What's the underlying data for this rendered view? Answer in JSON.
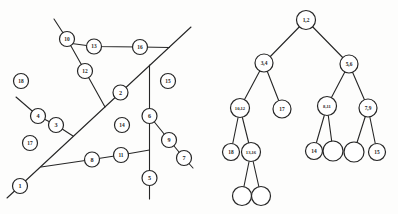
{
  "figure": {
    "colors": {
      "ink": "#262626",
      "paper": "#fdfdfc"
    },
    "graph": {
      "node_radius": 7.5,
      "nodes": [
        {
          "id": "1",
          "x": 20,
          "y": 186
        },
        {
          "id": "2",
          "x": 120.5,
          "y": 92.5
        },
        {
          "id": "3",
          "x": 56,
          "y": 125
        },
        {
          "id": "4",
          "x": 38,
          "y": 116
        },
        {
          "id": "5",
          "x": 149.5,
          "y": 178
        },
        {
          "id": "6",
          "x": 149.5,
          "y": 116
        },
        {
          "id": "7",
          "x": 184,
          "y": 158
        },
        {
          "id": "8",
          "x": 92,
          "y": 159.5
        },
        {
          "id": "9",
          "x": 169,
          "y": 140
        },
        {
          "id": "10",
          "x": 67,
          "y": 39
        },
        {
          "id": "11",
          "x": 121,
          "y": 155
        },
        {
          "id": "12",
          "x": 85,
          "y": 71
        },
        {
          "id": "13",
          "x": 94,
          "y": 46.5
        },
        {
          "id": "14",
          "x": 122,
          "y": 125
        },
        {
          "id": "15",
          "x": 168,
          "y": 81
        },
        {
          "id": "16",
          "x": 140,
          "y": 47
        },
        {
          "id": "17",
          "x": 30,
          "y": 143
        },
        {
          "id": "18",
          "x": 21,
          "y": 81
        }
      ],
      "segments": [
        {
          "name": "cut-line-1-2",
          "points": [
            [
              7,
              198
            ],
            [
              191,
              27
            ]
          ]
        },
        {
          "name": "cut-line-10-12",
          "points": [
            [
              54,
              19
            ],
            [
              67,
              39
            ],
            [
              85,
              71
            ],
            [
              105,
              107
            ]
          ]
        },
        {
          "name": "cut-line-13-16",
          "points": [
            [
              68,
              43
            ],
            [
              94,
              46.5
            ],
            [
              140,
              47
            ],
            [
              169.5,
              47.5
            ]
          ]
        },
        {
          "name": "cut-line-5-6",
          "points": [
            [
              149.5,
              65
            ],
            [
              149.5,
              199
            ]
          ]
        },
        {
          "name": "cut-line-7-9",
          "points": [
            [
              149.5,
              116
            ],
            [
              169,
              140
            ],
            [
              184,
              158
            ],
            [
              193,
              168
            ]
          ]
        },
        {
          "name": "cut-line-8-11",
          "points": [
            [
              41,
              167
            ],
            [
              92,
              159.5
            ],
            [
              121,
              155
            ],
            [
              149.5,
              150
            ]
          ]
        },
        {
          "name": "cut-line-3-4",
          "points": [
            [
              16,
              97
            ],
            [
              38,
              116
            ],
            [
              56,
              125
            ],
            [
              73,
              136
            ]
          ]
        }
      ]
    },
    "tree": {
      "nodes": [
        {
          "id": "t1",
          "label": "1,2",
          "x": 306,
          "y": 20,
          "r": 9.5
        },
        {
          "id": "t2",
          "label": "3,4",
          "x": 264,
          "y": 63,
          "r": 9
        },
        {
          "id": "t3",
          "label": "5,6",
          "x": 349,
          "y": 64,
          "r": 9
        },
        {
          "id": "t4",
          "label": "10,12",
          "x": 240,
          "y": 108,
          "r": 9.5
        },
        {
          "id": "t5",
          "label": "17",
          "x": 282,
          "y": 109,
          "r": 9
        },
        {
          "id": "t6",
          "label": "8,11",
          "x": 327,
          "y": 106,
          "r": 9.5
        },
        {
          "id": "t7",
          "label": "7,9",
          "x": 368,
          "y": 108,
          "r": 9
        },
        {
          "id": "t8",
          "label": "18",
          "x": 231,
          "y": 152,
          "r": 8.5
        },
        {
          "id": "t9",
          "label": "13,16",
          "x": 251,
          "y": 152,
          "r": 9.5
        },
        {
          "id": "t10",
          "label": "14",
          "x": 314,
          "y": 151,
          "r": 8.5
        },
        {
          "id": "t11",
          "label": "",
          "x": 333,
          "y": 151,
          "r": 10
        },
        {
          "id": "t12",
          "label": "",
          "x": 354,
          "y": 152,
          "r": 10
        },
        {
          "id": "t13",
          "label": "15",
          "x": 377,
          "y": 152,
          "r": 8.5
        },
        {
          "id": "t14",
          "label": "",
          "x": 242,
          "y": 196,
          "r": 9.5
        },
        {
          "id": "t15",
          "label": "",
          "x": 261,
          "y": 196,
          "r": 9.5
        }
      ],
      "edges": [
        [
          "t1",
          "t2"
        ],
        [
          "t1",
          "t3"
        ],
        [
          "t2",
          "t4"
        ],
        [
          "t2",
          "t5"
        ],
        [
          "t3",
          "t6"
        ],
        [
          "t3",
          "t7"
        ],
        [
          "t4",
          "t8"
        ],
        [
          "t4",
          "t9"
        ],
        [
          "t6",
          "t10"
        ],
        [
          "t6",
          "t11"
        ],
        [
          "t7",
          "t12"
        ],
        [
          "t7",
          "t13"
        ],
        [
          "t9",
          "t14"
        ],
        [
          "t9",
          "t15"
        ]
      ]
    }
  }
}
